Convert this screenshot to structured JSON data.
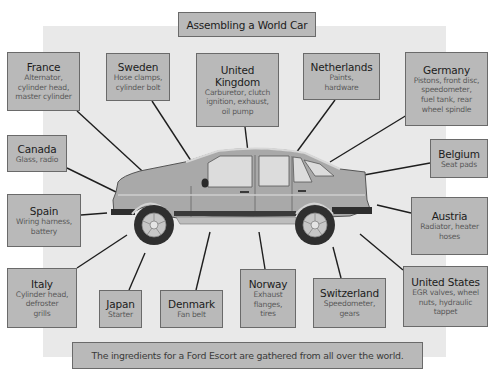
{
  "title": "Assembling a World Car",
  "caption": "The ingredients for a Ford Escort are gathered from all over the world.",
  "colors": {
    "panel": "#e9e9e9",
    "box_fill": "#b9b9b9",
    "box_border": "#6a6a6a",
    "country_text": "#1c1c1c",
    "parts_text": "#5a5a5a",
    "car_body": "#a9a9a9",
    "car_trim": "#3a3a3a"
  },
  "central_image": "car-side-view (Ford Escort hatchback)",
  "countries": [
    {
      "id": "france",
      "country": "France",
      "parts": [
        "Alternator,",
        "cylinder head,",
        "master cylinder"
      ]
    },
    {
      "id": "sweden",
      "country": "Sweden",
      "parts": [
        "Hose clamps,",
        "cylinder bolt"
      ]
    },
    {
      "id": "united-kingdom",
      "country": "United Kingdom",
      "country_lines": [
        "United",
        "Kingdom"
      ],
      "parts": [
        "Carburetor, clutch",
        "ignition, exhaust,",
        "oil pump"
      ]
    },
    {
      "id": "netherlands",
      "country": "Netherlands",
      "parts": [
        "Paints,",
        "hardware"
      ]
    },
    {
      "id": "germany",
      "country": "Germany",
      "parts": [
        "Pistons, front disc,",
        "speedometer,",
        "fuel tank, rear",
        "wheel spindle"
      ]
    },
    {
      "id": "canada",
      "country": "Canada",
      "parts": [
        "Glass, radio"
      ]
    },
    {
      "id": "belgium",
      "country": "Belgium",
      "parts": [
        "Seat pads"
      ]
    },
    {
      "id": "spain",
      "country": "Spain",
      "parts": [
        "Wiring harness,",
        "battery"
      ]
    },
    {
      "id": "austria",
      "country": "Austria",
      "parts": [
        "Radiator, heater",
        "hoses"
      ]
    },
    {
      "id": "italy",
      "country": "Italy",
      "parts": [
        "Cylinder head,",
        "defroster",
        "grills"
      ]
    },
    {
      "id": "japan",
      "country": "Japan",
      "parts": [
        "Starter"
      ]
    },
    {
      "id": "denmark",
      "country": "Denmark",
      "parts": [
        "Fan belt"
      ]
    },
    {
      "id": "norway",
      "country": "Norway",
      "parts": [
        "Exhaust",
        "flanges,",
        "tires"
      ]
    },
    {
      "id": "switzerland",
      "country": "Switzerland",
      "parts": [
        "Speedometer,",
        "gears"
      ]
    },
    {
      "id": "united-states",
      "country": "United States",
      "parts": [
        "EGR valves, wheel",
        "nuts, hydraulic",
        "tappet"
      ]
    }
  ]
}
